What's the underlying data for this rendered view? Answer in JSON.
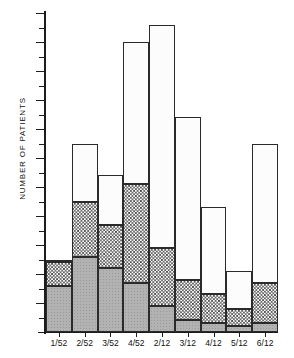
{
  "chart_data": {
    "type": "bar",
    "title": "",
    "xlabel": "",
    "ylabel": "NUMBER OF PATIENTS",
    "stacked": true,
    "grid": false,
    "legend": "none",
    "ylim": [
      0,
      110
    ],
    "yticks": [
      0,
      10,
      20,
      30,
      40,
      50,
      60,
      70,
      80,
      90,
      100,
      110
    ],
    "ytick_labels": [
      "",
      "10",
      "20",
      "30",
      "40",
      "50",
      "60",
      "70",
      "80",
      "90",
      "100",
      "110"
    ],
    "categories": [
      "1/52",
      "2/52",
      "3/52",
      "4/52",
      "2/12",
      "3/12",
      "4/12",
      "5/12",
      "6/12"
    ],
    "series": [
      {
        "name": "bottom-segment",
        "pattern": "solid-grey",
        "values": [
          16,
          26,
          22,
          17,
          9,
          4,
          3,
          2,
          3
        ]
      },
      {
        "name": "middle-segment",
        "pattern": "checkerboard",
        "values": [
          8,
          19,
          15,
          34,
          20,
          14,
          10,
          6,
          14
        ]
      },
      {
        "name": "top-segment",
        "pattern": "fine-stipple",
        "values": [
          1,
          20,
          17,
          49,
          77,
          56,
          30,
          13,
          48
        ]
      }
    ],
    "totals": [
      25,
      65,
      54,
      100,
      106,
      74,
      43,
      21,
      65
    ],
    "colors": {
      "bottom": "#b2b2b2",
      "middle": "#ffffff",
      "top": "#fcfcfc",
      "axis": "#1c1c1c",
      "outline": "#2a2a2a"
    }
  }
}
